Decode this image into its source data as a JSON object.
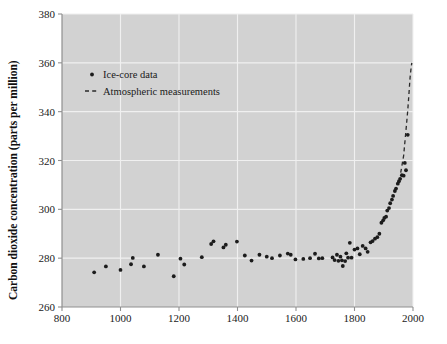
{
  "figure": {
    "background_color": "#ffffff",
    "plot_background_color": "#d2d2d2",
    "gridline_color": "#f0f0f0",
    "marker_color": "#1c1c1c",
    "dashline_color": "#2a2a2a",
    "axis_line_color": "#8a8a8a"
  },
  "axes": {
    "y_title": "Carbon dioxide concentration (parts per million)",
    "x_title": "",
    "y_ticks": [
      "260",
      "280",
      "300",
      "320",
      "340",
      "360",
      "380"
    ],
    "x_ticks": [
      "800",
      "1000",
      "1200",
      "1400",
      "1600",
      "1800",
      "2000"
    ]
  },
  "legend": {
    "items": [
      {
        "label": "Ice-core data",
        "marker": "dot"
      },
      {
        "label": "Atmospheric measurements",
        "marker": "dashed-line"
      }
    ]
  },
  "chart_data": {
    "type": "scatter",
    "title": "",
    "xlabel": "",
    "ylabel": "Carbon dioxide concentration (parts per million)",
    "xlim": [
      800,
      2000
    ],
    "ylim": [
      260,
      380
    ],
    "xticks": [
      800,
      1000,
      1200,
      1400,
      1600,
      1800,
      2000
    ],
    "yticks": [
      260,
      280,
      300,
      320,
      340,
      360,
      380
    ],
    "grid": true,
    "legend_position": "upper-left-inside",
    "series": [
      {
        "name": "Ice-core data",
        "type": "scatter",
        "marker": "dot",
        "color": "#1c1c1c",
        "points": [
          [
            910,
            274.2
          ],
          [
            950,
            276.6
          ],
          [
            1000,
            275.2
          ],
          [
            1036,
            277.5
          ],
          [
            1042,
            280.1
          ],
          [
            1080,
            276.6
          ],
          [
            1128,
            281.4
          ],
          [
            1182,
            272.6
          ],
          [
            1205,
            279.8
          ],
          [
            1218,
            277.4
          ],
          [
            1278,
            280.4
          ],
          [
            1310,
            285.8
          ],
          [
            1318,
            286.9
          ],
          [
            1352,
            284.4
          ],
          [
            1360,
            285.5
          ],
          [
            1398,
            286.8
          ],
          [
            1425,
            281.1
          ],
          [
            1448,
            279.0
          ],
          [
            1475,
            281.4
          ],
          [
            1500,
            280.6
          ],
          [
            1518,
            280.0
          ],
          [
            1545,
            281.1
          ],
          [
            1572,
            281.9
          ],
          [
            1582,
            281.4
          ],
          [
            1598,
            279.5
          ],
          [
            1625,
            279.7
          ],
          [
            1648,
            280.0
          ],
          [
            1665,
            281.8
          ],
          [
            1678,
            279.9
          ],
          [
            1690,
            280.0
          ],
          [
            1725,
            280.3
          ],
          [
            1732,
            279.2
          ],
          [
            1740,
            281.4
          ],
          [
            1745,
            278.9
          ],
          [
            1752,
            280.6
          ],
          [
            1757,
            279.1
          ],
          [
            1760,
            276.8
          ],
          [
            1768,
            278.8
          ],
          [
            1772,
            282.0
          ],
          [
            1778,
            280.2
          ],
          [
            1784,
            286.3
          ],
          [
            1790,
            280.2
          ],
          [
            1800,
            283.5
          ],
          [
            1810,
            284.0
          ],
          [
            1818,
            281.6
          ],
          [
            1828,
            285.0
          ],
          [
            1838,
            284.0
          ],
          [
            1845,
            282.6
          ],
          [
            1855,
            286.5
          ],
          [
            1862,
            287.0
          ],
          [
            1870,
            288.0
          ],
          [
            1878,
            288.6
          ],
          [
            1885,
            290.0
          ],
          [
            1892,
            294.5
          ],
          [
            1898,
            295.5
          ],
          [
            1902,
            296.5
          ],
          [
            1908,
            297.0
          ],
          [
            1912,
            299.5
          ],
          [
            1918,
            300.5
          ],
          [
            1922,
            302.5
          ],
          [
            1928,
            304.0
          ],
          [
            1932,
            305.5
          ],
          [
            1938,
            307.5
          ],
          [
            1942,
            308.5
          ],
          [
            1948,
            310.5
          ],
          [
            1952,
            311.5
          ],
          [
            1956,
            312.5
          ],
          [
            1962,
            314.0
          ],
          [
            1968,
            313.8
          ],
          [
            1972,
            319.0
          ],
          [
            1976,
            316.0
          ],
          [
            1982,
            330.5
          ]
        ]
      },
      {
        "name": "Atmospheric measurements",
        "type": "line",
        "style": "dashed",
        "color": "#2a2a2a",
        "points": [
          [
            1958,
            315.0
          ],
          [
            1968,
            322.0
          ],
          [
            1978,
            335.0
          ],
          [
            1982,
            340.5
          ],
          [
            1986,
            347.0
          ],
          [
            1990,
            354.0
          ],
          [
            1994,
            358.5
          ],
          [
            1996,
            360.0
          ]
        ]
      }
    ]
  }
}
